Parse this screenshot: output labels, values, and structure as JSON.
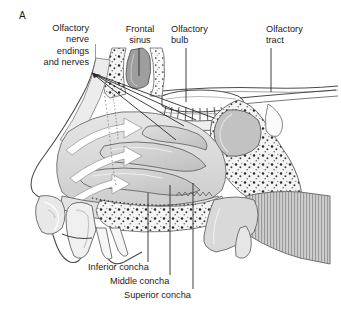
{
  "figure": {
    "panel_letter": "A",
    "background_color": "#ffffff",
    "ink_color": "#1a1a1a",
    "tissue_fill": "#d5d5d5",
    "tissue_fill_dark": "#b9b9b9",
    "cavity_fill": "#c9c9c9",
    "bone_fill": "#f2f2f2",
    "arrow_fill": "#ffffff"
  },
  "labels": {
    "olfactory_nerve": "Olfactory\nnerve\nendings\nand nerves",
    "frontal_sinus": "Frontal\nsinus",
    "olfactory_bulb": "Olfactory\nbulb",
    "olfactory_tract": "Olfactory\ntract",
    "inferior_concha": "Inferior concha",
    "middle_concha": "Middle concha",
    "superior_concha": "Superior concha"
  },
  "leaders": {
    "nerve_fan_origin": [
      92,
      73
    ],
    "frontal_sinus_line": [
      139,
      48,
      139,
      76
    ],
    "olfactory_bulb_line": [
      186,
      48,
      186,
      102
    ],
    "olfactory_tract_line": [
      271,
      48,
      271,
      92
    ],
    "inferior_concha_line": [
      148,
      193,
      148,
      262
    ],
    "middle_concha_line": [
      170,
      185,
      170,
      275
    ],
    "superior_concha_line": [
      193,
      183,
      193,
      289
    ]
  },
  "airflow_arrows": {
    "count": 3,
    "description": "white curved arrows showing inspired air streams through the nasal meatuses"
  }
}
